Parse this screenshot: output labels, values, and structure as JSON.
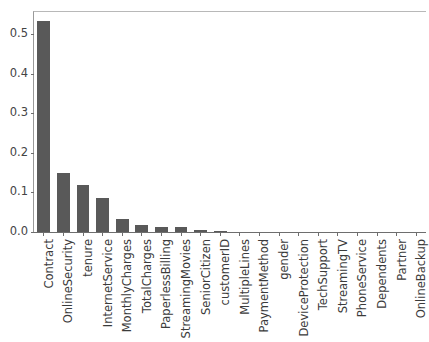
{
  "chart_data": {
    "type": "bar",
    "title": "",
    "subtitle": "",
    "xlabel": "",
    "ylabel": "",
    "ylim": [
      0.0,
      0.5565
    ],
    "xlim": [
      0,
      20
    ],
    "grid": false,
    "legend": null,
    "bar_color": "#595959",
    "orientation": "vertical",
    "categories": [
      "Contract",
      "OnlineSecurity",
      "tenure",
      "InternetService",
      "MonthlyCharges",
      "TotalCharges",
      "PaperlessBilling",
      "StreamingMovies",
      "SeniorCitizen",
      "customerID",
      "MultipleLines",
      "PaymentMethod",
      "gender",
      "DeviceProtection",
      "TechSupport",
      "StreamingTV",
      "PhoneService",
      "Dependents",
      "Partner",
      "OnlineBackup"
    ],
    "values": [
      0.535,
      0.15,
      0.12,
      0.087,
      0.033,
      0.019,
      0.012,
      0.012,
      0.004,
      0.003,
      0.0,
      0.0,
      0.0,
      0.0,
      0.0,
      0.0,
      0.0,
      0.0,
      0.0,
      0.0
    ],
    "ytick_labels": [
      "0.0",
      "0.1",
      "0.2",
      "0.3",
      "0.4",
      "0.5"
    ],
    "ytick_values": [
      0.0,
      0.1,
      0.2,
      0.3,
      0.4,
      0.5
    ]
  }
}
